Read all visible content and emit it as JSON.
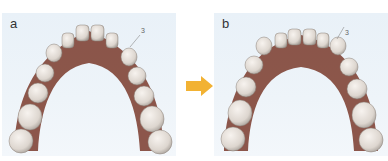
{
  "panels": [
    {
      "label": "a",
      "description": "Upper dental arch with crowding, tooth marked by small indicator",
      "marker": "3"
    },
    {
      "label": "b",
      "description": "Upper dental arch after alignment, tooth marked by small indicator",
      "marker": "3"
    }
  ],
  "arrow": {
    "color": "#f2b233",
    "direction": "right"
  },
  "colors": {
    "background": "#eaf1f8",
    "gum": "#7a3a2c",
    "tooth": "#e8e2dc"
  }
}
